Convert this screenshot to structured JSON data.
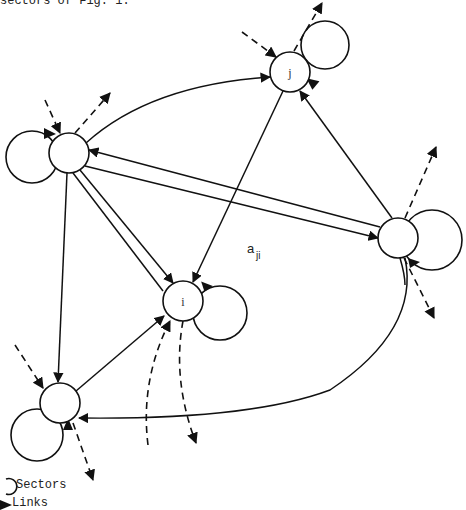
{
  "caption": "sectors of Fig. 1.",
  "nodes": [
    {
      "id": "left",
      "label": ""
    },
    {
      "id": "j",
      "label": "j"
    },
    {
      "id": "right",
      "label": ""
    },
    {
      "id": "i",
      "label": "i"
    },
    {
      "id": "bottom_left",
      "label": ""
    }
  ],
  "links": [
    {
      "from": "left",
      "to": "j",
      "type": "curve"
    },
    {
      "from": "right",
      "to": "left",
      "type": "straight"
    },
    {
      "from": "left",
      "to": "right",
      "type": "straight"
    },
    {
      "from": "left",
      "to": "i",
      "type": "straight"
    },
    {
      "from": "i",
      "to": "left",
      "type": "straight"
    },
    {
      "from": "left",
      "to": "bottom_left",
      "type": "straight"
    },
    {
      "from": "j",
      "to": "i",
      "type": "straight"
    },
    {
      "from": "right",
      "to": "j",
      "type": "straight"
    },
    {
      "from": "bottom_left",
      "to": "i",
      "type": "straight"
    },
    {
      "from": "right",
      "to": "bottom_left",
      "type": "curve"
    }
  ],
  "edge_label": {
    "base": "a",
    "sub": "ji"
  },
  "legend": {
    "sectors_label": "Sectors",
    "links_label": "Links"
  }
}
